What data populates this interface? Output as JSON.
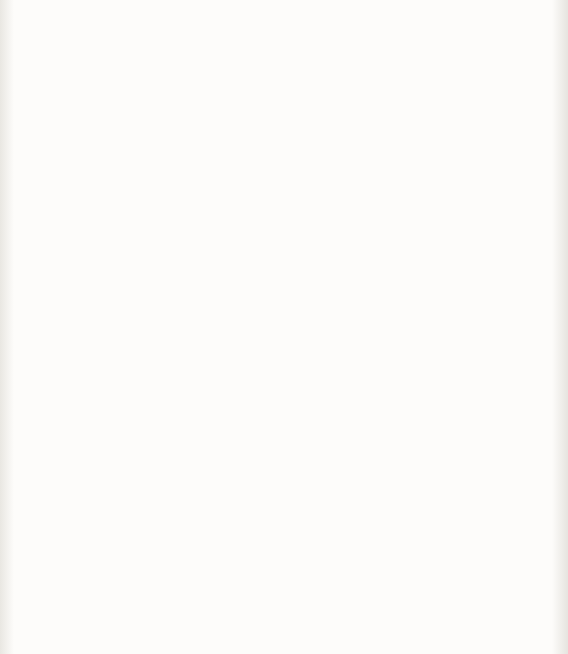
{
  "figure": {
    "kind": "scatter-plot",
    "background_color": "#fbfaf8",
    "ink_color": "#0b0b0b"
  },
  "chart_data": {
    "type": "scatter",
    "title": "",
    "xlabel_jp": "圧縮強度",
    "xlabel_symbol": "F",
    "xlabel_symbol_sub": "c",
    "xlabel_unit": "(N/mm²)",
    "ylabel_jp": "ヤング係数",
    "ylabel_symbol": "E",
    "ylabel_unit": "(N/mm²)",
    "xlim": [
      0,
      80
    ],
    "ylim": [
      0,
      70000
    ],
    "xticks": [
      "0",
      "20",
      "40",
      "60",
      "80"
    ],
    "xtick_values": [
      0,
      20,
      40,
      60,
      80
    ],
    "yticks": [
      "0",
      "10 000",
      "20 000",
      "30 000",
      "40 000",
      "50 000",
      "60 000",
      "70 000"
    ],
    "ytick_values": [
      0,
      10000,
      20000,
      30000,
      40000,
      50000,
      60000,
      70000
    ],
    "grid": false,
    "legend_position": "none",
    "marker_classes": [
      {
        "name": "open-circle",
        "glyph": "circle-open",
        "band": "main",
        "count_approx": 430
      },
      {
        "name": "open-square",
        "glyph": "square-open",
        "band": "main",
        "count_approx": 330
      },
      {
        "name": "filled-triangle-up",
        "glyph": "triangle-up-filled",
        "band": "upper",
        "count_approx": 60
      },
      {
        "name": "filled-square",
        "glyph": "square-filled",
        "band": "top",
        "count_approx": 10
      },
      {
        "name": "filled-triangle-down",
        "glyph": "triangle-down-filled",
        "band": "lower",
        "count_approx": 28
      },
      {
        "name": "plus",
        "glyph": "plus",
        "band": "lower",
        "count_approx": 70
      },
      {
        "name": "cross",
        "glyph": "cross-x",
        "band": "lower",
        "count_approx": 120
      }
    ],
    "fit_curve": {
      "label": "E = 21 000 x (gamma/23)^1.5 x N-root(sigma_B/20)",
      "points": [
        [
          0,
          0
        ],
        [
          1,
          9000
        ],
        [
          2,
          12500
        ],
        [
          4,
          17000
        ],
        [
          6,
          19800
        ],
        [
          8,
          21800
        ],
        [
          10,
          23300
        ],
        [
          14,
          25500
        ],
        [
          18,
          27300
        ],
        [
          22,
          28700
        ],
        [
          26,
          29900
        ],
        [
          30,
          30900
        ],
        [
          35,
          32000
        ],
        [
          40,
          32900
        ],
        [
          45,
          33700
        ],
        [
          50,
          34400
        ],
        [
          55,
          35000
        ],
        [
          60,
          35500
        ],
        [
          65,
          36000
        ],
        [
          70,
          36400
        ],
        [
          75,
          36800
        ],
        [
          80,
          37100
        ]
      ]
    },
    "annotations": [
      {
        "id": "upper-formula",
        "expression_plain": "E = 33 500 x k1 x k2 x (gamma/24)^2 x (Fc/60)^(1/3)",
        "condition_plain": "[k1 = k2 = 1, gamma = 24]",
        "lead_coefficient": "33 500",
        "exponent_gamma": "2",
        "exponent_fc": "1/3",
        "denominator_gamma": "24",
        "denominator_fc": "60",
        "points_to": "upper-trend-of-scatter"
      },
      {
        "id": "lower-formula",
        "expression_plain": "E = 21 000 x (gamma/23)^1.5 x N-root(sigma_B/20)",
        "condition_plain": "[gamma = 23]",
        "lead_coefficient": "21 000",
        "exponent_gamma": "1.5",
        "denominator_gamma": "23",
        "radical_numerator": "sigma_B",
        "radical_denominator": "20",
        "radical_index": "N",
        "points_to": "fit-curve"
      }
    ]
  },
  "labels": {
    "eq1": {
      "E": "E",
      "eq": "=",
      "coef": "33 500",
      "times": "×",
      "k1": "k",
      "k1sub": "1",
      "k2": "k",
      "k2sub": "2",
      "gamma": "γ",
      "g_den": "24",
      "g_exp": "2",
      "Fc": "F",
      "Fc_sub": "c",
      "fc_den": "60",
      "fc_exp_num": "1",
      "fc_exp_den": "3",
      "cond_open": "[",
      "cond": "k₁=k₂=1,  γ=24",
      "cond_close": "]"
    },
    "eq2": {
      "E": "E",
      "eq": "=",
      "coef": "21 000",
      "times": "×",
      "gamma": "γ",
      "g_den": "23",
      "g_exp": "1.5",
      "root_index": "N",
      "sigma": "σ",
      "sigma_sub": "B",
      "root_den": "20",
      "cond": "[γ =23]"
    }
  }
}
